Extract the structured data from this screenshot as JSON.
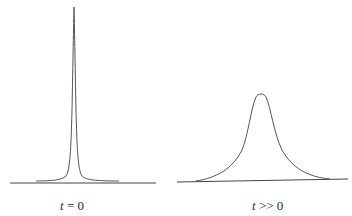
{
  "figure": {
    "panels": [
      {
        "id": "left",
        "label_var": "t",
        "label_rest": " = 0",
        "description": "narrow sharp peak"
      },
      {
        "id": "right",
        "label_var": "t",
        "label_rest": " >> 0",
        "description": "broad peak"
      }
    ],
    "colors": {
      "line": "#555555",
      "axis": "#444444",
      "background": "#ffffff"
    }
  }
}
